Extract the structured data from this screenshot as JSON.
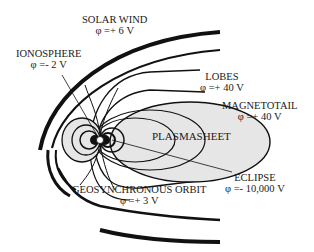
{
  "diagram": {
    "labels": {
      "solar_wind": {
        "name": "SOLAR WIND",
        "potential": "φ =+ 6 V"
      },
      "ionosphere": {
        "name": "IONOSPHERE",
        "potential": "φ =- 2 V"
      },
      "lobes": {
        "name": "LOBES",
        "potential": "φ =+ 40 V"
      },
      "magnetotail": {
        "name": "MAGNETOTAIL",
        "potential": "φ =+ 40 V"
      },
      "plasmasheet": {
        "name": "PLASMASHEET"
      },
      "eclipse": {
        "name": "ECLIPSE",
        "potential": "φ =- 10,000 V"
      },
      "geosynchronous_orbit": {
        "name": "GEOSYNCHRONOUS ORBIT",
        "potential": "φ =+ 3 V"
      }
    },
    "colors": {
      "line": "#111111",
      "plasmasheet_fill": "#e6e6e6",
      "background": "#ffffff"
    }
  }
}
